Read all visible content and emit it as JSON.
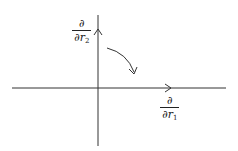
{
  "diagram": {
    "type": "coordinate-axes",
    "axes": {
      "horizontal": {
        "label": {
          "numerator": "∂",
          "denominator": "∂r",
          "subscript": "1"
        }
      },
      "vertical": {
        "label": {
          "numerator": "∂",
          "denominator": "∂r",
          "subscript": "2"
        }
      }
    },
    "rotation_arrow": {
      "direction": "clockwise",
      "from": "vertical",
      "to": "horizontal"
    },
    "colors": {
      "stroke": "#222222",
      "background": "#ffffff"
    }
  }
}
